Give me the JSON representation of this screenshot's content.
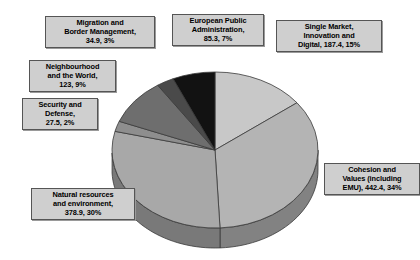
{
  "chart_data": {
    "type": "pie",
    "title": "",
    "subtitle": "",
    "xlabel": "",
    "ylabel": "",
    "legend_position": "none",
    "grid": false,
    "three_d": true,
    "total": 1274.4,
    "unit": "EUR billion",
    "categories": [
      "Single Market, Innovation and Digital",
      "Cohesion and Values (including EMU)",
      "Natural resources and environment",
      "Security and Defense",
      "Neighbourhood and the World",
      "Migration and Border Management",
      "European Public Administration"
    ],
    "values": [
      187.4,
      442.4,
      378.9,
      27.5,
      123,
      34.9,
      85.3
    ],
    "percents": [
      15,
      34,
      30,
      2,
      9,
      3,
      7
    ],
    "slices": [
      {
        "name": "Single Market, Innovation and Digital",
        "value": 187.4,
        "percent": 15,
        "color": "#c8c8c8"
      },
      {
        "name": "Cohesion and Values (including EMU)",
        "value": 442.4,
        "percent": 34,
        "color": "#b4b4b4"
      },
      {
        "name": "Natural resources and environment",
        "value": 378.9,
        "percent": 30,
        "color": "#a8a8a8"
      },
      {
        "name": "Security and Defense",
        "value": 27.5,
        "percent": 2,
        "color": "#8e8e8e"
      },
      {
        "name": "Neighbourhood and the World",
        "value": 123,
        "percent": 9,
        "color": "#6e6e6e"
      },
      {
        "name": "Migration and Border Management",
        "value": 34.9,
        "percent": 3,
        "color": "#4a4a4a"
      },
      {
        "name": "European Public Administration",
        "value": 85.3,
        "percent": 7,
        "color": "#121212"
      }
    ]
  },
  "labels": {
    "migration": "Migration and\nBorder Management,\n34.9, 3%",
    "european_public_administration": "European Public\nAdministration,\n85.3, 7%",
    "single_market": "Single Market,\nInnovation and\nDigital, 187.4, 15%",
    "neighbourhood": "Neighbourhood\nand the World,\n123, 9%",
    "security": "Security and\nDefense,\n27.5, 2%",
    "natural_resources": "Natural resources\nand environment,\n378.9, 30%",
    "cohesion": "Cohesion and\nValues (including\nEMU), 442.4, 34%"
  },
  "colors": {
    "background": "#ffffff",
    "callout_fill": "#cfcfcf",
    "callout_border": "#555555",
    "slice_outline": "#3a3a3a"
  }
}
